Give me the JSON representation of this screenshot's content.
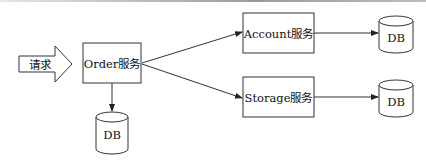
{
  "diagram": {
    "request": {
      "label": "请求"
    },
    "nodes": [
      {
        "id": "order",
        "label": "Order服务"
      },
      {
        "id": "account",
        "label": "Account服务"
      },
      {
        "id": "storage",
        "label": "Storage服务"
      }
    ],
    "databases": [
      {
        "id": "order-db",
        "label": "DB"
      },
      {
        "id": "account-db",
        "label": "DB"
      },
      {
        "id": "storage-db",
        "label": "DB"
      }
    ],
    "edges": [
      {
        "from": "request",
        "to": "order"
      },
      {
        "from": "order",
        "to": "account"
      },
      {
        "from": "order",
        "to": "storage"
      },
      {
        "from": "order",
        "to": "order-db"
      },
      {
        "from": "account",
        "to": "account-db"
      },
      {
        "from": "storage",
        "to": "storage-db"
      }
    ]
  }
}
